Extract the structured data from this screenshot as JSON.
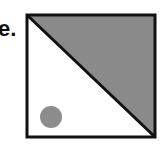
{
  "label": "e.",
  "figure": {
    "square": {
      "x": 26,
      "y": 14,
      "width": 129,
      "height": 123,
      "stroke": "#111111"
    },
    "shaded_triangle": {
      "fill": "#8a8a8a",
      "corners": [
        "top-left",
        "top-right",
        "bottom-right"
      ]
    },
    "diagonal": {
      "from": "top-left",
      "to": "bottom-right"
    },
    "dot": {
      "cx": 51,
      "cy": 117,
      "r": 11,
      "fill": "#8c8c8c"
    }
  }
}
